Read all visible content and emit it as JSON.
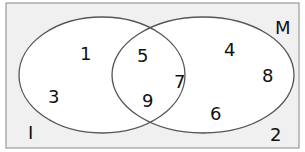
{
  "diagram": {
    "type": "venn",
    "universal_set_label": "2",
    "sets": [
      {
        "name": "I",
        "label": "I",
        "only_elements": [
          "1",
          "3"
        ]
      },
      {
        "name": "M",
        "label": "M",
        "only_elements": [
          "4",
          "8",
          "6"
        ]
      }
    ],
    "intersection_elements": [
      "5",
      "7",
      "9"
    ],
    "outside_elements": [
      "2"
    ],
    "colors": {
      "background": "#f0f0f0",
      "ellipse_fill": "#ffffff",
      "stroke": "#555555",
      "text": "#111111"
    }
  },
  "labels": {
    "set_i": "I",
    "set_m": "M",
    "n1": "1",
    "n3": "3",
    "n5": "5",
    "n7": "7",
    "n9": "9",
    "n4": "4",
    "n8": "8",
    "n6": "6",
    "n2": "2"
  }
}
